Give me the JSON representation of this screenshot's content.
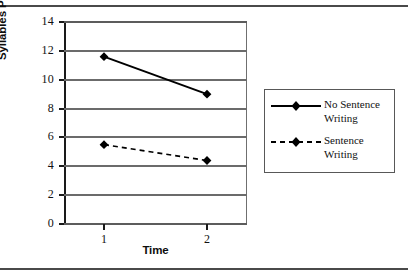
{
  "chart_data": {
    "type": "line",
    "title": "",
    "xlabel": "Time",
    "ylabel": "Syllables Produced",
    "x": [
      1,
      2
    ],
    "xtick_labels": [
      "1",
      "2"
    ],
    "ytick_labels": [
      "0",
      "2",
      "4",
      "6",
      "8",
      "10",
      "12",
      "14"
    ],
    "ylim": [
      0,
      14
    ],
    "ytick_step": 2,
    "grid": "horizontal",
    "legend_position": "right",
    "series": [
      {
        "name": "No Sentence\nWriting",
        "name_flat": "No Sentence Writing",
        "values": [
          11.6,
          9.0
        ],
        "line_style": "solid",
        "marker": "diamond",
        "color": "#000000"
      },
      {
        "name": "Sentence\nWriting",
        "name_flat": "Sentence Writing",
        "values": [
          5.5,
          4.4
        ],
        "line_style": "dashed",
        "marker": "diamond",
        "color": "#000000"
      }
    ]
  },
  "figure": {
    "top_rule_color": "#4a4a4a",
    "bottom_rule_color": "#4a4a4a",
    "gridline_color": "#6b6b6b",
    "axis_color": "#1a1a1a",
    "background": "#ffffff"
  }
}
